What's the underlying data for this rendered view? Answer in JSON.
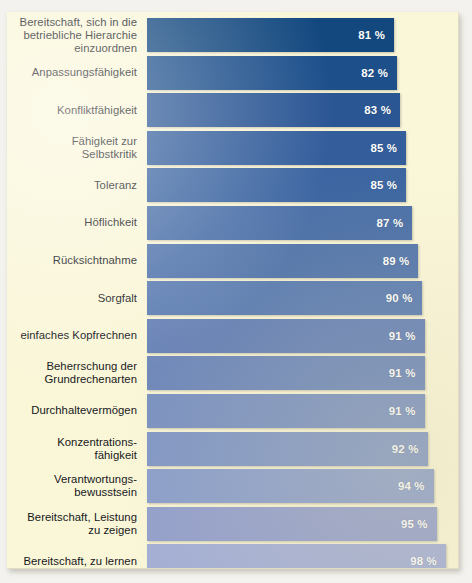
{
  "page": {
    "title_remnant": "",
    "panel_background": "#faf6d8",
    "page_background": "#f3f2ee",
    "label_color": "#15171b",
    "value_color": "#ffffff"
  },
  "chart_data": {
    "type": "bar",
    "orientation": "horizontal",
    "title": "",
    "subtitle": "",
    "xlabel": "",
    "ylabel": "",
    "xlim": [
      0,
      100
    ],
    "unit": "%",
    "grid": false,
    "legend": null,
    "value_label_position": "inside-end",
    "bar_color_scheme": "sequential blue, darkest for lowest value to lightest for highest value",
    "categories": [
      "Bereitschaft, sich in die\nbetriebliche Hierarchie\neinzuordnen",
      "Anpassungsfähigkeit",
      "Konfliktfähigkeit",
      "Fähigkeit zur\nSelbstkritik",
      "Toleranz",
      "Höflichkeit",
      "Rücksichtnahme",
      "Sorgfalt",
      "einfaches Kopfrechnen",
      "Beherrschung der\nGrundrechenarten",
      "Durchhaltevermögen",
      "Konzentrations-\nfähigkeit",
      "Verantwortungs-\nbewusstsein",
      "Bereitschaft, Leistung\nzu zeigen",
      "Bereitschaft, zu lernen"
    ],
    "values": [
      81,
      82,
      83,
      85,
      85,
      87,
      89,
      90,
      91,
      91,
      91,
      92,
      94,
      95,
      98
    ],
    "value_labels": [
      "81 %",
      "82 %",
      "83 %",
      "85 %",
      "85 %",
      "87 %",
      "89 %",
      "90 %",
      "91 %",
      "91 %",
      "91 %",
      "92 %",
      "94 %",
      "95 %",
      "98 %"
    ],
    "bar_colors": [
      "#13487f",
      "#1d4f8b",
      "#2b5694",
      "#335d9b",
      "#3c65a1",
      "#4a6fa8",
      "#5275ac",
      "#5b7cb2",
      "#6580b6",
      "#6d87ba",
      "#7a91c1",
      "#8096c5",
      "#8b9ecb",
      "#939fcc",
      "#a3aed6"
    ]
  }
}
